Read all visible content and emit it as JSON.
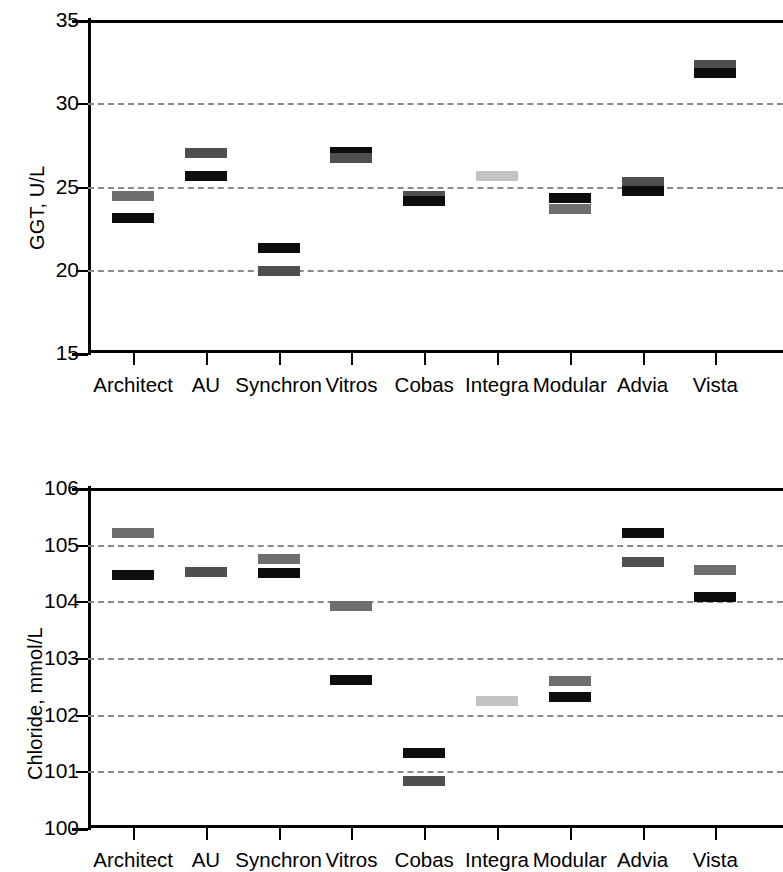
{
  "figure": {
    "panels": [
      "ggt-panel",
      "chloride-panel"
    ]
  },
  "chart_data": [
    {
      "type": "scatter",
      "id": "ggt",
      "title": "",
      "xlabel": "",
      "ylabel": "GGT, U/L",
      "ylim": [
        15,
        35
      ],
      "yticks": [
        15,
        20,
        25,
        30,
        35
      ],
      "ytick_labels": [
        "15",
        "20",
        "25",
        "30",
        "35"
      ],
      "gridlines": [
        20,
        25,
        30
      ],
      "grid": true,
      "legend": "none",
      "categories": [
        "Architect",
        "AU",
        "Synchron",
        "Vitros",
        "Cobas",
        "Integra",
        "Modular",
        "Advia",
        "Vista"
      ],
      "series": [
        {
          "name": "upper-marker",
          "values": [
            24.45,
            27.0,
            21.3,
            27.1,
            24.4,
            25.65,
            24.3,
            25.25,
            32.3
          ],
          "shades": [
            "mid",
            "dark",
            "black",
            "black",
            "dark",
            "light",
            "black",
            "dark",
            "dark"
          ]
        },
        {
          "name": "lower-marker",
          "values": [
            23.1,
            25.65,
            19.95,
            26.7,
            24.1,
            null,
            23.65,
            24.75,
            31.8
          ],
          "shades": [
            "black",
            "black",
            "dark",
            "dark",
            "black",
            null,
            "mid",
            "black",
            "black"
          ]
        }
      ]
    },
    {
      "type": "scatter",
      "id": "chloride",
      "title": "",
      "xlabel": "",
      "ylabel": "Chloride, mmol/L",
      "ylim": [
        100,
        106
      ],
      "yticks": [
        100,
        101,
        102,
        103,
        104,
        105,
        106
      ],
      "ytick_labels": [
        "100",
        "101",
        "102",
        "103",
        "104",
        "105",
        "106"
      ],
      "gridlines": [
        101,
        102,
        103,
        104,
        105
      ],
      "grid": true,
      "legend": "none",
      "categories": [
        "Architect",
        "AU",
        "Synchron",
        "Vitros",
        "Cobas",
        "Integra",
        "Modular",
        "Advia",
        "Vista"
      ],
      "series": [
        {
          "name": "upper-marker",
          "values": [
            105.2,
            104.52,
            104.75,
            103.92,
            101.32,
            102.24,
            102.6,
            105.2,
            104.55
          ],
          "shades": [
            "mid",
            "dark",
            "mid",
            "mid",
            "black",
            "light",
            "mid",
            "black",
            "mid"
          ]
        },
        {
          "name": "lower-marker",
          "values": [
            104.47,
            null,
            104.5,
            102.62,
            100.83,
            null,
            102.32,
            104.7,
            104.08
          ],
          "shades": [
            "black",
            null,
            "black",
            "black",
            "dark",
            null,
            "black",
            "dark",
            "black"
          ]
        }
      ]
    }
  ],
  "colors": {
    "black": "#0d0d0d",
    "dark": "#4f4f4f",
    "mid": "#6e6e6e",
    "light": "#c3c3c3",
    "grid": "#8a8a8a",
    "axis": "#000000",
    "background": "#ffffff"
  }
}
